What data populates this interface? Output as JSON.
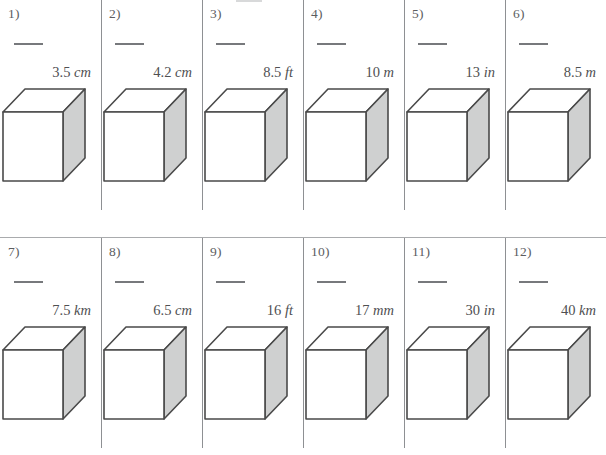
{
  "worksheet": {
    "type": "math-worksheet",
    "shape": "cube",
    "columns": 6,
    "rows": 2,
    "total_problems": 12,
    "colors": {
      "page_background": "#ffffff",
      "text": "#58585a",
      "separator_line": "#8e9093",
      "mid_rule": "#a9abad",
      "answer_blank": "#77797c",
      "cube_outline": "#4a4a4a",
      "cube_front_face": "#ffffff",
      "cube_top_face": "#ffffff",
      "cube_right_face": "#cfd0d0"
    }
  },
  "problems": [
    {
      "number": "1)",
      "value": "3.5",
      "unit": "cm",
      "answer": ""
    },
    {
      "number": "2)",
      "value": "4.2",
      "unit": "cm",
      "answer": ""
    },
    {
      "number": "3)",
      "value": "8.5",
      "unit": "ft",
      "answer": ""
    },
    {
      "number": "4)",
      "value": "10",
      "unit": "m",
      "answer": ""
    },
    {
      "number": "5)",
      "value": "13",
      "unit": "in",
      "answer": ""
    },
    {
      "number": "6)",
      "value": "8.5",
      "unit": "m",
      "answer": ""
    },
    {
      "number": "7)",
      "value": "7.5",
      "unit": "km",
      "answer": ""
    },
    {
      "number": "8)",
      "value": "6.5",
      "unit": "cm",
      "answer": ""
    },
    {
      "number": "9)",
      "value": "16",
      "unit": "ft",
      "answer": ""
    },
    {
      "number": "10)",
      "value": "17",
      "unit": "mm",
      "answer": ""
    },
    {
      "number": "11)",
      "value": "30",
      "unit": "in",
      "answer": ""
    },
    {
      "number": "12)",
      "value": "40",
      "unit": "km",
      "answer": ""
    }
  ]
}
